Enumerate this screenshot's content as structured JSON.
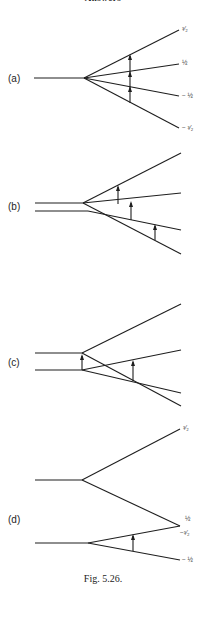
{
  "header": {
    "text": "Answers"
  },
  "panels": [
    {
      "label": "(a)",
      "levels": [
        "³⁄₂",
        "½",
        "− ½",
        "− ³⁄₂"
      ]
    },
    {
      "label": "(b)",
      "levels": []
    },
    {
      "label": "(c)",
      "levels": []
    },
    {
      "label": "(d)",
      "levels": [
        "³⁄₂",
        "½",
        "−³⁄₂",
        "− ½"
      ]
    }
  ],
  "caption": "Fig. 5.26."
}
